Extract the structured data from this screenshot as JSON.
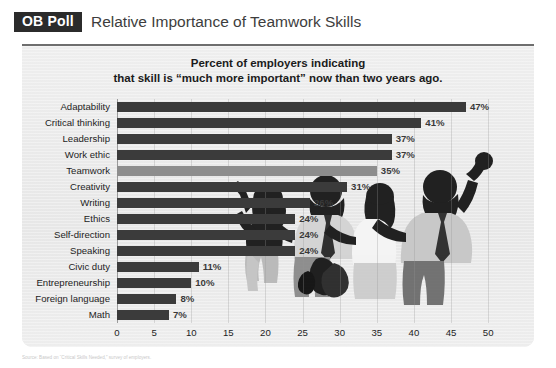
{
  "header": {
    "badge": "OB Poll",
    "title": "Relative Importance of Teamwork Skills"
  },
  "chart_title_line1": "Percent of employers indicating",
  "chart_title_line2": "that skill is “much more important” now than two years ago.",
  "source_note": "Source: Based on “Critical Skills Needed,” survey of employers.",
  "colors": {
    "bar": "#3b3b3b",
    "bar_highlight": "#8d8d8d",
    "panel": "#ebebeb",
    "badge": "#2b2b2b",
    "text": "#1d1d1d"
  },
  "chart_data": {
    "type": "bar",
    "orientation": "horizontal",
    "title": "Percent of employers indicating that skill is “much more important” now than two years ago.",
    "xlabel": "",
    "ylabel": "",
    "xlim": [
      0,
      52
    ],
    "xticks": [
      0,
      5,
      10,
      15,
      20,
      25,
      30,
      35,
      40,
      45,
      50
    ],
    "grid": true,
    "legend": "none",
    "value_suffix": "%",
    "highlight_category": "Teamwork",
    "categories": [
      "Adaptability",
      "Critical thinking",
      "Leadership",
      "Work ethic",
      "Teamwork",
      "Creativity",
      "Writing",
      "Ethics",
      "Self-direction",
      "Speaking",
      "Civic duty",
      "Entrepreneurship",
      "Foreign language",
      "Math"
    ],
    "values": [
      47,
      41,
      37,
      37,
      35,
      31,
      26,
      24,
      24,
      24,
      11,
      10,
      8,
      7
    ],
    "data_labels": [
      "47%",
      "41%",
      "37%",
      "37%",
      "35%",
      "31%",
      "26%",
      "24%",
      "24%",
      "24%",
      "11%",
      "10%",
      "8%",
      "7%"
    ]
  }
}
